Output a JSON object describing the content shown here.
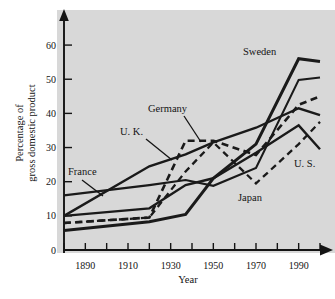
{
  "chart_data": {
    "type": "line",
    "title": "",
    "xlabel": "Year",
    "ylabel": "Percentage of gross domestic product",
    "ylabel_line1": "Percentage of",
    "ylabel_line2": "gross domestic product",
    "grid": false,
    "legend_position": "inline-annotations",
    "background_color": "#d8d8d8",
    "line_color": "#1a1a1a",
    "xlim": [
      1880,
      2000
    ],
    "ylim": [
      0,
      65
    ],
    "x_ticks_labeled": [
      1890,
      1910,
      1930,
      1950,
      1970,
      1990
    ],
    "x_ticks_minor": [
      1880,
      1900,
      1920,
      1940,
      1960,
      1980,
      2000
    ],
    "x_tick_labels": [
      "1890",
      "1910",
      "1930",
      "1950",
      "1970",
      "1990"
    ],
    "y_ticks": [
      0,
      10,
      20,
      30,
      40,
      50,
      60
    ],
    "y_tick_labels": [
      "0",
      "10",
      "20",
      "30",
      "40",
      "50",
      "60"
    ],
    "x": [
      1880,
      1920,
      1937,
      1950,
      1970,
      1990,
      2000
    ],
    "series": [
      {
        "name": "Sweden",
        "label": "Sweden",
        "style": "solid-thick",
        "values": [
          5.7,
          8.3,
          10.4,
          21.0,
          31.0,
          56.0,
          55.2
        ]
      },
      {
        "name": "France",
        "label": "France",
        "style": "solid-thin",
        "values": [
          16.0,
          19.0,
          20.5,
          18.8,
          24.0,
          49.8,
          50.5
        ]
      },
      {
        "name": "Germany",
        "label": "Germany",
        "style": "dashed",
        "values": [
          7.9,
          9.5,
          32.0,
          32.0,
          27.8,
          42.5,
          45.0
        ]
      },
      {
        "name": "U. K.",
        "label": "U. K.",
        "style": "solid-med",
        "values": [
          10.0,
          24.5,
          28.0,
          31.5,
          35.8,
          41.5,
          39.5
        ]
      },
      {
        "name": "U. S.",
        "label": "U. S.",
        "style": "solid-med",
        "values": [
          10.0,
          12.2,
          19.0,
          21.0,
          28.5,
          36.5,
          29.5
        ]
      },
      {
        "name": "Japan",
        "label": "Japan",
        "style": "dashed-thin",
        "values": [
          7.9,
          9.5,
          23.0,
          31.5,
          19.5,
          31.0,
          37.5
        ]
      }
    ],
    "annotations": [
      {
        "name": "Sweden",
        "text": "Sweden",
        "x_px": 243,
        "y_px": 55,
        "leader": null
      },
      {
        "name": "Germany",
        "text": "Germany",
        "x_px": 148,
        "y_px": 112,
        "leader": [
          184,
          116,
          201,
          142
        ]
      },
      {
        "name": "U. K.",
        "text": "U. K.",
        "x_px": 120,
        "y_px": 135,
        "leader": [
          146,
          139,
          172,
          160
        ]
      },
      {
        "name": "France",
        "text": "France",
        "x_px": 68,
        "y_px": 175,
        "leader": [
          82,
          180,
          103,
          196
        ]
      },
      {
        "name": "Japan",
        "text": "Japan",
        "x_px": 238,
        "y_px": 201,
        "leader": null
      },
      {
        "name": "U. S.",
        "text": "U. S.",
        "x_px": 294,
        "y_px": 167,
        "leader": null
      }
    ]
  },
  "axis": {
    "x_title": "Year",
    "y_title_line1": "Percentage of",
    "y_title_line2": "gross domestic product"
  }
}
